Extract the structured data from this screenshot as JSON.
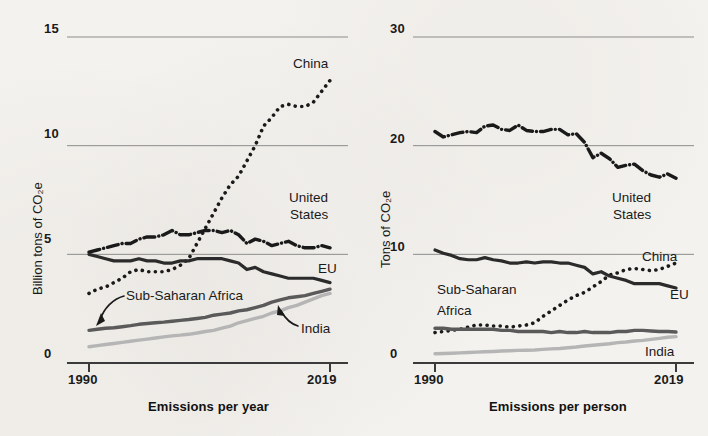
{
  "figure": {
    "background_color": "#f4f2ee",
    "ink_color": "#1a1a1a",
    "panels": 2
  },
  "left_panel": {
    "ylabel": "Billion tons of CO₂e",
    "xlabel": "Emissions per year",
    "yticks": [
      "15",
      "10",
      "5",
      "0"
    ],
    "xticks": [
      "1990",
      "2019"
    ],
    "series_labels": {
      "china": "China",
      "united_states": "United\nStates",
      "united_states_line1": "United",
      "united_states_line2": "States",
      "eu": "EU",
      "sub_saharan_africa": "Sub-Saharan Africa",
      "india": "India"
    }
  },
  "right_panel": {
    "ylabel": "Tons of CO₂e",
    "xlabel": "Emissions per person",
    "yticks": [
      "30",
      "20",
      "10",
      "0"
    ],
    "xticks": [
      "1990",
      "2019"
    ],
    "series_labels": {
      "united_states_line1": "United",
      "united_states_line2": "States",
      "china": "China",
      "eu": "EU",
      "sub_saharan_africa_line1": "Sub-Saharan",
      "sub_saharan_africa_line2": "Africa",
      "india": "India"
    }
  },
  "chart_data": [
    {
      "type": "line",
      "id": "emissions-per-year",
      "title": "Emissions per year",
      "xlabel": "Emissions per year",
      "ylabel": "Billion tons of CO₂e",
      "xlim": [
        1990,
        2019
      ],
      "ylim": [
        0,
        15
      ],
      "yticks": [
        0,
        5,
        10,
        15
      ],
      "xticks": [
        1990,
        2019
      ],
      "grid": "horizontal",
      "legend": "inline-labels",
      "x": [
        1990,
        1991,
        1992,
        1993,
        1994,
        1995,
        1996,
        1997,
        1998,
        1999,
        2000,
        2001,
        2002,
        2003,
        2004,
        2005,
        2006,
        2007,
        2008,
        2009,
        2010,
        2011,
        2012,
        2013,
        2014,
        2015,
        2016,
        2017,
        2018,
        2019
      ],
      "series": [
        {
          "name": "China",
          "style": "dotted",
          "color": "#1a1a1a",
          "values": [
            3.2,
            3.4,
            3.5,
            3.7,
            3.9,
            4.2,
            4.3,
            4.2,
            4.2,
            4.2,
            4.3,
            4.5,
            4.8,
            5.5,
            6.2,
            6.9,
            7.6,
            8.2,
            8.6,
            9.3,
            10.0,
            10.9,
            11.3,
            11.8,
            11.9,
            11.8,
            11.8,
            12.0,
            12.5,
            13.0
          ]
        },
        {
          "name": "United States",
          "style": "dash-dot",
          "color": "#1a1a1a",
          "values": [
            5.1,
            5.2,
            5.3,
            5.4,
            5.5,
            5.5,
            5.7,
            5.8,
            5.8,
            5.9,
            6.1,
            5.9,
            5.9,
            6.0,
            6.1,
            6.1,
            6.0,
            6.1,
            5.9,
            5.5,
            5.7,
            5.6,
            5.4,
            5.5,
            5.6,
            5.4,
            5.3,
            5.3,
            5.4,
            5.3
          ]
        },
        {
          "name": "EU",
          "style": "solid",
          "color": "#2b2b2b",
          "width": 3.2,
          "values": [
            5.0,
            4.9,
            4.8,
            4.7,
            4.7,
            4.7,
            4.8,
            4.7,
            4.7,
            4.6,
            4.6,
            4.7,
            4.7,
            4.8,
            4.8,
            4.8,
            4.8,
            4.7,
            4.6,
            4.3,
            4.4,
            4.2,
            4.1,
            4.0,
            3.9,
            3.9,
            3.9,
            3.9,
            3.8,
            3.7
          ]
        },
        {
          "name": "Sub-Saharan Africa",
          "style": "solid",
          "color": "#5a5a5a",
          "width": 3.4,
          "values": [
            1.5,
            1.55,
            1.6,
            1.62,
            1.67,
            1.72,
            1.78,
            1.82,
            1.85,
            1.88,
            1.92,
            1.96,
            2.0,
            2.05,
            2.1,
            2.2,
            2.25,
            2.3,
            2.4,
            2.45,
            2.55,
            2.65,
            2.8,
            2.9,
            3.0,
            3.05,
            3.1,
            3.2,
            3.3,
            3.4
          ]
        },
        {
          "name": "India",
          "style": "solid",
          "color": "#b5b5b5",
          "width": 3.4,
          "values": [
            0.75,
            0.8,
            0.85,
            0.9,
            0.95,
            1.0,
            1.05,
            1.1,
            1.15,
            1.2,
            1.25,
            1.28,
            1.32,
            1.38,
            1.45,
            1.5,
            1.6,
            1.7,
            1.85,
            1.95,
            2.05,
            2.15,
            2.3,
            2.4,
            2.55,
            2.65,
            2.8,
            2.95,
            3.1,
            3.2
          ]
        }
      ]
    },
    {
      "type": "line",
      "id": "emissions-per-person",
      "title": "Emissions per person",
      "xlabel": "Emissions per person",
      "ylabel": "Tons of CO₂e",
      "xlim": [
        1990,
        2019
      ],
      "ylim": [
        0,
        30
      ],
      "yticks": [
        0,
        10,
        20,
        30
      ],
      "xticks": [
        1990,
        2019
      ],
      "grid": "horizontal",
      "legend": "inline-labels",
      "x": [
        1990,
        1991,
        1992,
        1993,
        1994,
        1995,
        1996,
        1997,
        1998,
        1999,
        2000,
        2001,
        2002,
        2003,
        2004,
        2005,
        2006,
        2007,
        2008,
        2009,
        2010,
        2011,
        2012,
        2013,
        2014,
        2015,
        2016,
        2017,
        2018,
        2019
      ],
      "series": [
        {
          "name": "United States",
          "style": "dash-dot",
          "color": "#1a1a1a",
          "values": [
            21.3,
            20.8,
            21.0,
            21.2,
            21.3,
            21.2,
            21.8,
            21.9,
            21.5,
            21.4,
            21.9,
            21.4,
            21.3,
            21.3,
            21.5,
            21.5,
            21.0,
            21.1,
            20.3,
            18.9,
            19.3,
            18.8,
            18.0,
            18.2,
            18.3,
            17.7,
            17.3,
            17.1,
            17.4,
            17.0
          ]
        },
        {
          "name": "China",
          "style": "dotted",
          "color": "#1a1a1a",
          "values": [
            2.8,
            2.9,
            3.0,
            3.1,
            3.3,
            3.5,
            3.5,
            3.4,
            3.4,
            3.3,
            3.4,
            3.5,
            3.7,
            4.3,
            4.8,
            5.3,
            5.8,
            6.2,
            6.5,
            7.0,
            7.5,
            8.1,
            8.3,
            8.6,
            8.7,
            8.6,
            8.5,
            8.6,
            8.9,
            9.2
          ]
        },
        {
          "name": "EU",
          "style": "solid",
          "color": "#2b2b2b",
          "width": 3.2,
          "values": [
            10.4,
            10.1,
            9.9,
            9.6,
            9.5,
            9.5,
            9.7,
            9.5,
            9.4,
            9.2,
            9.2,
            9.3,
            9.2,
            9.3,
            9.3,
            9.2,
            9.2,
            9.0,
            8.8,
            8.2,
            8.4,
            8.0,
            7.8,
            7.6,
            7.3,
            7.3,
            7.3,
            7.3,
            7.1,
            6.9
          ]
        },
        {
          "name": "Sub-Saharan Africa",
          "style": "solid",
          "color": "#5a5a5a",
          "width": 3.4,
          "values": [
            3.2,
            3.2,
            3.1,
            3.1,
            3.1,
            3.1,
            3.1,
            3.1,
            3.0,
            3.0,
            2.9,
            2.9,
            2.9,
            2.9,
            2.8,
            2.9,
            2.8,
            2.8,
            2.9,
            2.8,
            2.8,
            2.8,
            2.9,
            2.9,
            3.0,
            3.0,
            2.95,
            2.9,
            2.9,
            2.85
          ]
        },
        {
          "name": "India",
          "style": "solid",
          "color": "#b5b5b5",
          "width": 3.4,
          "values": [
            0.85,
            0.88,
            0.9,
            0.93,
            0.96,
            1.0,
            1.03,
            1.06,
            1.1,
            1.13,
            1.16,
            1.18,
            1.2,
            1.25,
            1.3,
            1.33,
            1.4,
            1.47,
            1.57,
            1.63,
            1.7,
            1.77,
            1.87,
            1.93,
            2.03,
            2.08,
            2.17,
            2.27,
            2.37,
            2.43
          ]
        }
      ]
    }
  ]
}
